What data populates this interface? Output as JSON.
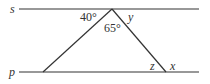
{
  "diagram": {
    "type": "geometry",
    "lines": [
      {
        "name": "s",
        "label": "s"
      },
      {
        "name": "p",
        "label": "p"
      }
    ],
    "angles": [
      {
        "label": "40°",
        "position": "between line s (left) and left side of triangle at apex"
      },
      {
        "label": "65°",
        "position": "apex interior angle of triangle"
      },
      {
        "label": "y",
        "position": "between line s (right) and right side of triangle at apex"
      },
      {
        "label": "z",
        "position": "interior angle at bottom-right vertex"
      },
      {
        "label": "x",
        "position": "exterior angle at bottom-right vertex on line p"
      }
    ],
    "colors": {
      "stroke": "#333333",
      "background": "#ffffff"
    }
  }
}
